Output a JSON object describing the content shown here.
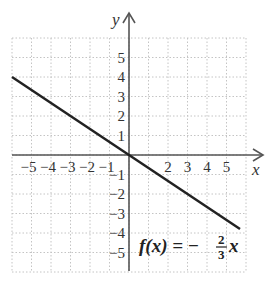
{
  "chart_data": {
    "type": "line",
    "title": "",
    "xlabel": "x",
    "ylabel": "y",
    "xlim": [
      -6,
      6
    ],
    "ylim": [
      -6,
      6
    ],
    "grid": true,
    "x_ticks": [
      "−5",
      "−4",
      "−3",
      "−2",
      "−1",
      "2",
      "3",
      "4",
      "5"
    ],
    "y_ticks": [
      "5",
      "4",
      "3",
      "2",
      "1",
      "−1",
      "−2",
      "−3",
      "−4",
      "−5"
    ],
    "series": [
      {
        "name": "f(x) = −(2/3)x",
        "x": [
          -6,
          0,
          6
        ],
        "y": [
          4,
          0,
          -4
        ]
      }
    ],
    "annotation": {
      "lhs": "f(x) = −",
      "numerator": "2",
      "denominator": "3",
      "var": "x"
    }
  },
  "colors": {
    "axis": "#555555",
    "line": "#222222",
    "grid": "#bbbbbb"
  }
}
